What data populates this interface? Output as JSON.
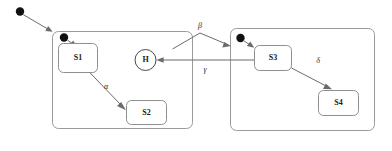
{
  "diagram": {
    "kind": "uml-statechart",
    "title": "",
    "colors": {
      "background": "#ffffff",
      "region_stroke": "#9a9a9a",
      "state_stroke": "#8f8f8f",
      "edge_stroke": "#6b6b6b",
      "initial_dot_fill": "#111111",
      "text": "#1a1a1a"
    },
    "regions": [
      {
        "id": "left-region",
        "label": ""
      },
      {
        "id": "right-region",
        "label": ""
      }
    ],
    "states": [
      {
        "id": "s1",
        "label": "S1"
      },
      {
        "id": "s2",
        "label": "S2"
      },
      {
        "id": "s3",
        "label": "S3"
      },
      {
        "id": "s4",
        "label": "S4"
      }
    ],
    "pseudostates": [
      {
        "id": "history",
        "label": "H",
        "kind": "shallow-history"
      },
      {
        "id": "initial-outer",
        "label": "",
        "kind": "initial"
      },
      {
        "id": "initial-left",
        "label": "",
        "kind": "initial"
      },
      {
        "id": "initial-right",
        "label": "",
        "kind": "initial"
      }
    ],
    "transitions": [
      {
        "id": "t-alpha",
        "label": "α",
        "from": "s1",
        "to": "s2"
      },
      {
        "id": "t-beta",
        "label": "β",
        "from": "left-region",
        "to": "right-region"
      },
      {
        "id": "t-gamma",
        "label": "γ",
        "from": "right-region",
        "to": "history"
      },
      {
        "id": "t-delta",
        "label": "δ",
        "from": "s3",
        "to": "s4"
      },
      {
        "id": "t-init-outer",
        "label": "",
        "from": "initial-outer",
        "to": "left-region"
      },
      {
        "id": "t-init-left",
        "label": "",
        "from": "initial-left",
        "to": "s1"
      },
      {
        "id": "t-init-right",
        "label": "",
        "from": "initial-right",
        "to": "s3"
      }
    ]
  }
}
